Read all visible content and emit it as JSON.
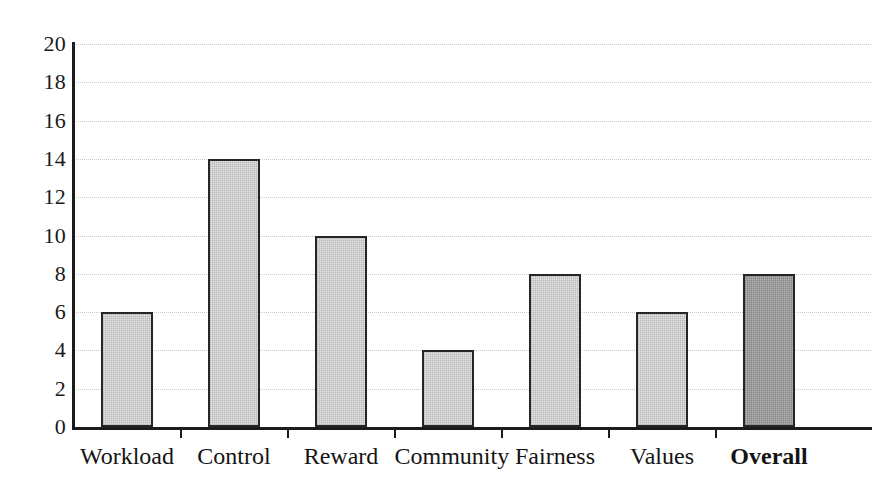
{
  "chart_data": {
    "type": "bar",
    "title": "",
    "subtitle": "",
    "xlabel": "",
    "ylabel": "",
    "categories": [
      "Workload",
      "Control",
      "Reward",
      "Community",
      "Fairness",
      "Values",
      "Overall"
    ],
    "values": [
      6,
      14,
      10,
      4,
      8,
      6,
      8
    ],
    "ylim": [
      0,
      20
    ],
    "ytick_labels": [
      "20",
      "18",
      "16",
      "14",
      "12",
      "10",
      "8",
      "6",
      "4",
      "2",
      "0"
    ],
    "ytick_values": [
      20,
      18,
      16,
      14,
      12,
      10,
      8,
      6,
      4,
      2,
      0
    ],
    "ytick_step": 2,
    "grid": "horizontal-dotted",
    "legend": "none",
    "bar_styles": [
      "light",
      "light",
      "light",
      "light",
      "light",
      "light",
      "dark"
    ],
    "emphasis_category": "Overall",
    "colors": {
      "bar_light_fill": "#e4e4e4",
      "bar_dark_fill": "#b4b4b4",
      "bar_border": "#262626",
      "gridline": "#c9c9c9",
      "axis": "#1c1c1c",
      "text": "#1a1a1a",
      "background": "#ffffff"
    }
  }
}
